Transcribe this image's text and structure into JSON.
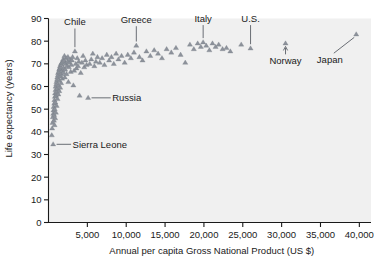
{
  "chart_data": {
    "type": "scatter",
    "title": "",
    "xlabel": "Annual per capita Gross National Product (US $)",
    "ylabel": "Life expectancy (years)",
    "xlim": [
      0,
      41500
    ],
    "ylim": [
      0,
      90
    ],
    "grid": false,
    "legend": "none",
    "marker": "triangle",
    "marker_color": "#8d929b",
    "background": "#f0f0f0",
    "xticks": [
      5000,
      10000,
      15000,
      20000,
      25000,
      30000,
      35000,
      40000
    ],
    "xtick_labels": [
      "5,000",
      "10,000",
      "15,000",
      "20,000",
      "25,000",
      "30,000",
      "35,000",
      "40,000"
    ],
    "yticks": [
      0,
      10,
      20,
      30,
      40,
      50,
      60,
      70,
      80,
      90
    ],
    "ytick_labels": [
      "0",
      "10",
      "20",
      "30",
      "40",
      "50",
      "60",
      "70",
      "80",
      "90"
    ],
    "annotations": [
      {
        "label": "Chile",
        "x": 3400,
        "y": 75.5,
        "label_x": 2700,
        "label_y": 87.0,
        "leader": "down"
      },
      {
        "label": "Greece",
        "x": 11300,
        "y": 78.0,
        "label_x": 10600,
        "label_y": 88.0,
        "leader": "down"
      },
      {
        "label": "Italy",
        "x": 19900,
        "y": 79.5,
        "label_x": 19400,
        "label_y": 88.5,
        "leader": "down"
      },
      {
        "label": "U.S.",
        "x": 26000,
        "y": 76.8,
        "label_x": 25300,
        "label_y": 88.5,
        "leader": "down"
      },
      {
        "label": "Norway",
        "x": 30500,
        "y": 79.0,
        "label_x": 30500,
        "label_y": 70.0,
        "leader": "up"
      },
      {
        "label": "Japan",
        "x": 39600,
        "y": 83.0,
        "label_x": 36200,
        "label_y": 70.5,
        "leader": "diag-up"
      },
      {
        "label": "Russia",
        "x": 5100,
        "y": 55.0,
        "label_x": 8200,
        "label_y": 55.0,
        "leader": "right"
      },
      {
        "label": "Sierra Leone",
        "x": 600,
        "y": 34.5,
        "label_x": 3100,
        "label_y": 34.5,
        "leader": "right"
      }
    ],
    "points": [
      [
        420,
        38.5
      ],
      [
        470,
        41.5
      ],
      [
        520,
        44.0
      ],
      [
        560,
        46.5
      ],
      [
        600,
        34.5
      ],
      [
        610,
        48.0
      ],
      [
        640,
        49.5
      ],
      [
        660,
        51.0
      ],
      [
        700,
        45.0
      ],
      [
        720,
        47.5
      ],
      [
        740,
        52.5
      ],
      [
        760,
        54.0
      ],
      [
        780,
        43.0
      ],
      [
        800,
        50.0
      ],
      [
        820,
        55.5
      ],
      [
        840,
        57.0
      ],
      [
        860,
        46.0
      ],
      [
        880,
        53.0
      ],
      [
        900,
        58.5
      ],
      [
        920,
        60.0
      ],
      [
        950,
        48.5
      ],
      [
        980,
        56.0
      ],
      [
        1000,
        61.0
      ],
      [
        1020,
        62.0
      ],
      [
        1050,
        51.5
      ],
      [
        1080,
        57.5
      ],
      [
        1100,
        63.0
      ],
      [
        1130,
        64.0
      ],
      [
        1160,
        54.5
      ],
      [
        1190,
        59.0
      ],
      [
        1210,
        65.0
      ],
      [
        1240,
        66.0
      ],
      [
        1270,
        56.5
      ],
      [
        1300,
        60.5
      ],
      [
        1330,
        66.5
      ],
      [
        1360,
        67.5
      ],
      [
        1390,
        58.0
      ],
      [
        1420,
        62.5
      ],
      [
        1450,
        68.0
      ],
      [
        1480,
        69.0
      ],
      [
        1510,
        59.5
      ],
      [
        1540,
        64.5
      ],
      [
        1570,
        68.5
      ],
      [
        1600,
        70.0
      ],
      [
        1630,
        61.5
      ],
      [
        1660,
        65.5
      ],
      [
        1690,
        69.5
      ],
      [
        1720,
        70.5
      ],
      [
        1760,
        63.5
      ],
      [
        1800,
        67.0
      ],
      [
        1840,
        71.0
      ],
      [
        1880,
        72.0
      ],
      [
        1920,
        66.0
      ],
      [
        1960,
        68.0
      ],
      [
        2000,
        71.5
      ],
      [
        2050,
        73.5
      ],
      [
        2100,
        64.0
      ],
      [
        2150,
        67.5
      ],
      [
        2200,
        70.0
      ],
      [
        2260,
        72.5
      ],
      [
        2320,
        65.5
      ],
      [
        2380,
        69.0
      ],
      [
        2440,
        71.0
      ],
      [
        2500,
        73.0
      ],
      [
        2560,
        62.0
      ],
      [
        2620,
        68.5
      ],
      [
        2700,
        70.5
      ],
      [
        2780,
        72.0
      ],
      [
        2860,
        66.5
      ],
      [
        2940,
        69.5
      ],
      [
        3020,
        71.5
      ],
      [
        3100,
        73.0
      ],
      [
        3200,
        60.5
      ],
      [
        3300,
        67.0
      ],
      [
        3400,
        75.5
      ],
      [
        3500,
        70.0
      ],
      [
        3600,
        68.0
      ],
      [
        3700,
        72.5
      ],
      [
        3800,
        69.0
      ],
      [
        3900,
        71.0
      ],
      [
        4000,
        56.0
      ],
      [
        4150,
        66.0
      ],
      [
        4300,
        70.5
      ],
      [
        4450,
        73.5
      ],
      [
        4600,
        68.5
      ],
      [
        4750,
        71.5
      ],
      [
        4900,
        69.5
      ],
      [
        5100,
        55.0
      ],
      [
        5300,
        70.0
      ],
      [
        5500,
        72.0
      ],
      [
        5700,
        74.5
      ],
      [
        5900,
        69.0
      ],
      [
        6100,
        71.0
      ],
      [
        6300,
        73.0
      ],
      [
        6600,
        70.5
      ],
      [
        6900,
        72.5
      ],
      [
        7200,
        69.5
      ],
      [
        7500,
        74.0
      ],
      [
        7800,
        71.5
      ],
      [
        8100,
        73.0
      ],
      [
        8400,
        70.0
      ],
      [
        8700,
        74.5
      ],
      [
        9000,
        72.0
      ],
      [
        9400,
        73.5
      ],
      [
        9800,
        70.5
      ],
      [
        10200,
        74.0
      ],
      [
        10600,
        72.5
      ],
      [
        11000,
        75.0
      ],
      [
        11300,
        78.0
      ],
      [
        11700,
        73.0
      ],
      [
        12100,
        71.5
      ],
      [
        12600,
        75.5
      ],
      [
        13100,
        73.5
      ],
      [
        13600,
        76.0
      ],
      [
        14100,
        74.5
      ],
      [
        14600,
        72.5
      ],
      [
        15200,
        76.5
      ],
      [
        15800,
        75.0
      ],
      [
        16400,
        77.0
      ],
      [
        17000,
        74.0
      ],
      [
        17600,
        70.5
      ],
      [
        18200,
        78.5
      ],
      [
        18700,
        76.5
      ],
      [
        19200,
        79.0
      ],
      [
        19600,
        77.5
      ],
      [
        19900,
        79.5
      ],
      [
        20300,
        78.0
      ],
      [
        20700,
        76.0
      ],
      [
        21100,
        79.0
      ],
      [
        21500,
        77.5
      ],
      [
        21900,
        78.5
      ],
      [
        22400,
        76.5
      ],
      [
        22900,
        77.0
      ],
      [
        23400,
        75.5
      ],
      [
        24800,
        78.5
      ],
      [
        26000,
        76.8
      ],
      [
        30500,
        79.0
      ],
      [
        39600,
        83.0
      ]
    ]
  },
  "figure": {
    "width": 377,
    "height": 267
  }
}
